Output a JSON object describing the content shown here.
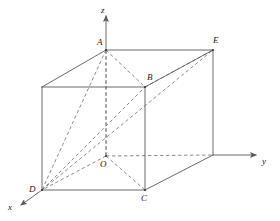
{
  "figure": {
    "background_color": "#ffffff",
    "stroke_color": "#5a5a5a",
    "dashed_color": "#6e6e6e",
    "label_color": "#1a1a1a",
    "width": 280,
    "height": 221
  },
  "axes": [
    {
      "id": "x",
      "label": "x",
      "label_x": 8,
      "label_y": 203,
      "arrow": "tip-lower-left"
    },
    {
      "id": "y",
      "label": "y",
      "label_x": 262,
      "label_y": 157,
      "arrow": "tip-right"
    },
    {
      "id": "z",
      "label": "z",
      "label_x": 101,
      "label_y": 6,
      "arrow": "tip-up"
    }
  ],
  "vertices": [
    {
      "id": "A",
      "label": "A",
      "x": 106,
      "y": 50,
      "label_x": 97,
      "label_y": 38
    },
    {
      "id": "B",
      "label": "B",
      "x": 145,
      "y": 87,
      "label_x": 147,
      "label_y": 73
    },
    {
      "id": "C",
      "label": "C",
      "x": 145,
      "y": 190,
      "label_x": 141,
      "label_y": 194
    },
    {
      "id": "D",
      "label": "D",
      "x": 42,
      "y": 190,
      "label_x": 29,
      "label_y": 185
    },
    {
      "id": "E",
      "label": "E",
      "x": 213,
      "y": 50,
      "label_x": 213,
      "label_y": 36
    },
    {
      "id": "O",
      "label": "O",
      "x": 106,
      "y": 156,
      "label_x": 100,
      "label_y": 160
    }
  ],
  "solid_edges": [
    {
      "name": "front-top-edge",
      "x1": 42,
      "y1": 87,
      "x2": 145,
      "y2": 87
    },
    {
      "name": "front-left-edge",
      "x1": 42,
      "y1": 87,
      "x2": 42,
      "y2": 190
    },
    {
      "name": "front-bottom-edge",
      "x1": 42,
      "y1": 190,
      "x2": 145,
      "y2": 190
    },
    {
      "name": "front-right-edge",
      "x1": 145,
      "y1": 87,
      "x2": 145,
      "y2": 190
    },
    {
      "name": "top-left-diagonal-edge",
      "x1": 42,
      "y1": 87,
      "x2": 106,
      "y2": 50
    },
    {
      "name": "top-front-right-diagonal-edge",
      "x1": 145,
      "y1": 87,
      "x2": 213,
      "y2": 50
    },
    {
      "name": "top-back-edge",
      "x1": 106,
      "y1": 50,
      "x2": 213,
      "y2": 50
    },
    {
      "name": "back-right-vertical-edge",
      "x1": 213,
      "y1": 50,
      "x2": 213,
      "y2": 155
    },
    {
      "name": "bottom-right-diagonal-edge",
      "x1": 145,
      "y1": 190,
      "x2": 213,
      "y2": 155
    }
  ],
  "dashed_edges": [
    {
      "name": "z-axis-segment-A-to-O",
      "x1": 106,
      "y1": 50,
      "x2": 106,
      "y2": 156
    },
    {
      "name": "y-axis-segment-O-to-back-right",
      "x1": 106,
      "y1": 156,
      "x2": 213,
      "y2": 155
    },
    {
      "name": "back-left-vertical-edge-O-to-A",
      "x1": 106,
      "y1": 156,
      "x2": 106,
      "y2": 50
    },
    {
      "name": "bottom-back-left-edge-O-to-D",
      "x1": 106,
      "y1": 156,
      "x2": 42,
      "y2": 190
    },
    {
      "name": "bottom-back-edge-O-to-C",
      "x1": 106,
      "y1": 156,
      "x2": 145,
      "y2": 190
    },
    {
      "name": "diagonal-A-to-B",
      "x1": 106,
      "y1": 50,
      "x2": 145,
      "y2": 87
    },
    {
      "name": "diagonal-A-to-D",
      "x1": 106,
      "y1": 50,
      "x2": 42,
      "y2": 190
    },
    {
      "name": "diagonal-D-to-B",
      "x1": 42,
      "y1": 190,
      "x2": 145,
      "y2": 87
    },
    {
      "name": "diagonal-D-to-E",
      "x1": 42,
      "y1": 190,
      "x2": 213,
      "y2": 50
    },
    {
      "name": "diagonal-B-to-E",
      "x1": 145,
      "y1": 87,
      "x2": 213,
      "y2": 50
    }
  ],
  "axis_lines": {
    "z_axis": {
      "name": "z-axis-shaft",
      "x1": 106,
      "y1": 50,
      "x2": 106,
      "y2": 16
    },
    "y_axis": {
      "name": "y-axis-shaft",
      "x1": 213,
      "y1": 155,
      "x2": 256,
      "y2": 155
    },
    "x_axis": {
      "name": "x-axis-shaft",
      "x1": 42,
      "y1": 190,
      "x2": 21,
      "y2": 205
    }
  }
}
